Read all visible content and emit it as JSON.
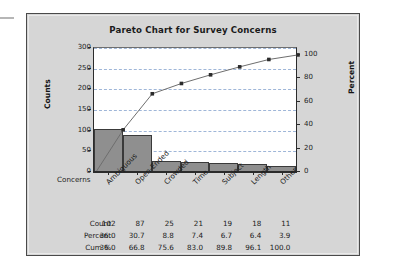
{
  "chart_data": {
    "type": "bar",
    "title": "Pareto Chart for Survey Concerns",
    "xlabel": "Concerns",
    "ylabel": "Counts",
    "y2label": "Percent",
    "categories": [
      "Ambiguous",
      "Open-Ended",
      "Crowded",
      "Time",
      "Subject",
      "Length",
      "Other"
    ],
    "values": [
      102,
      87,
      25,
      21,
      19,
      18,
      11
    ],
    "series": [
      {
        "name": "Count",
        "values": [
          102,
          87,
          25,
          21,
          19,
          18,
          11
        ]
      },
      {
        "name": "Percent",
        "values": [
          36.0,
          30.7,
          8.8,
          7.4,
          6.7,
          6.4,
          3.9
        ]
      },
      {
        "name": "Cum %",
        "values": [
          36.0,
          66.8,
          75.6,
          83.0,
          89.8,
          96.1,
          100.0
        ]
      }
    ],
    "ylim": [
      0,
      300
    ],
    "yticks": [
      0,
      50,
      100,
      150,
      200,
      250,
      300
    ],
    "y2lim": [
      0,
      105.9
    ],
    "y2ticks": [
      0,
      20,
      40,
      60,
      80,
      100
    ],
    "grid": true,
    "legend": "none",
    "total_count": 283,
    "colors": {
      "bar_fill": "#8f8f8f",
      "bar_edge": "#3a3a3a",
      "line": "#6e6e6e",
      "marker": "#2b2b2b",
      "grid": "#9fb6d8",
      "panel_bg": "#d6d6d6",
      "plot_bg": "#ffffff",
      "axis": "#2b2b2b"
    }
  },
  "table": {
    "row_labels": [
      "Count",
      "Percent",
      "Cum %"
    ],
    "rows": [
      [
        "102",
        "87",
        "25",
        "21",
        "19",
        "18",
        "11"
      ],
      [
        "36.0",
        "30.7",
        "8.8",
        "7.4",
        "6.7",
        "6.4",
        "3.9"
      ],
      [
        "36.0",
        "66.8",
        "75.6",
        "83.0",
        "89.8",
        "96.1",
        "100.0"
      ]
    ]
  }
}
